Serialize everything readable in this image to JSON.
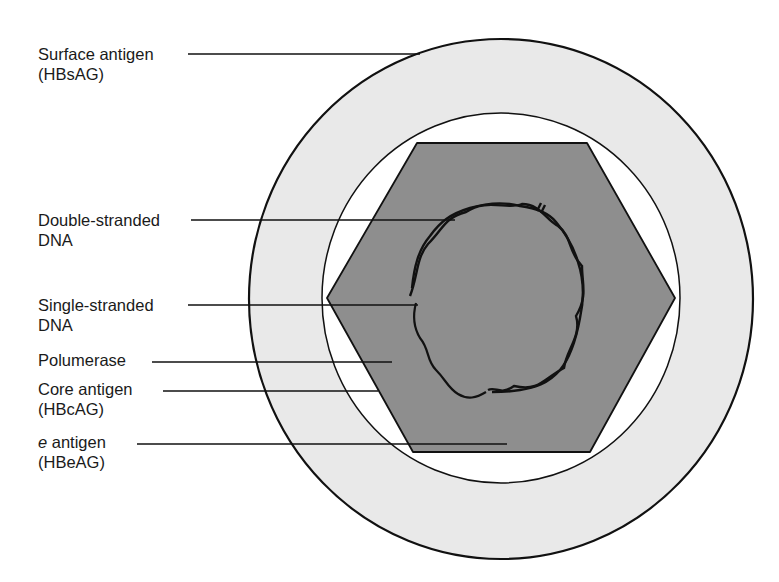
{
  "diagram": {
    "colors": {
      "background": "#ffffff",
      "outer_ring": "#e9e9e9",
      "inner_space": "#ffffff",
      "hexagon": "#8e8e8e",
      "stroke": "#111111"
    },
    "labels": [
      {
        "id": "surface-antigen",
        "line1": "Surface antigen",
        "line2": "(HBsAG)"
      },
      {
        "id": "double-stranded-dna",
        "line1": "Double-stranded",
        "line2": "DNA"
      },
      {
        "id": "single-stranded-dna",
        "line1": "Single-stranded",
        "line2": "DNA"
      },
      {
        "id": "polymerase",
        "line1": "Polumerase",
        "line2": ""
      },
      {
        "id": "core-antigen",
        "line1": "Core antigen",
        "line2": "(HBcAG)"
      },
      {
        "id": "e-antigen",
        "line1_italic": "e",
        "line1": " antigen",
        "line2": "(HBeAG)"
      }
    ]
  }
}
